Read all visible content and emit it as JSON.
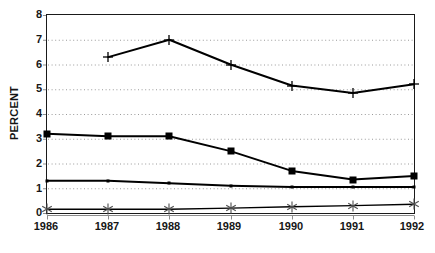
{
  "chart_data": {
    "type": "line",
    "title": "",
    "subtitle": "",
    "xlabel": "",
    "ylabel": "PERCENT",
    "categories": [
      "1986",
      "1987",
      "1988",
      "1989",
      "1990",
      "1991",
      "1992"
    ],
    "x": [
      1986,
      1987,
      1988,
      1989,
      1990,
      1991,
      1992
    ],
    "xlim": [
      1986,
      1992
    ],
    "ylim": [
      0,
      8
    ],
    "yticks": [
      0,
      1,
      2,
      3,
      4,
      5,
      6,
      7,
      8
    ],
    "ytick_labels": [
      "0",
      "1",
      "2",
      "3",
      "4",
      "5",
      "6",
      "7",
      "8"
    ],
    "xtick_labels": [
      "1986",
      "1987",
      "1988",
      "1989",
      "1990",
      "1991",
      "1992"
    ],
    "grid": "horizontal-dotted",
    "legend": "none",
    "series": [
      {
        "name": "series-plus",
        "marker": "plus",
        "color": "#000000",
        "values": [
          null,
          6.3,
          7.0,
          6.0,
          5.15,
          4.85,
          5.2
        ]
      },
      {
        "name": "series-square",
        "marker": "square",
        "color": "#000000",
        "values": [
          3.2,
          3.1,
          3.1,
          2.5,
          1.7,
          1.35,
          1.5
        ]
      },
      {
        "name": "series-line",
        "marker": "dot",
        "color": "#000000",
        "values": [
          1.3,
          1.3,
          1.2,
          1.1,
          1.05,
          1.05,
          1.05
        ]
      },
      {
        "name": "series-star",
        "marker": "star",
        "color": "#000000",
        "values": [
          0.15,
          0.15,
          0.15,
          0.2,
          0.25,
          0.3,
          0.35
        ]
      }
    ]
  },
  "axes": {
    "y_title": "PERCENT",
    "y_labels": [
      "8",
      "7",
      "6",
      "5",
      "4",
      "3",
      "2",
      "1",
      "0"
    ],
    "x_labels": [
      "1986",
      "1987",
      "1988",
      "1989",
      "1990",
      "1991",
      "1992"
    ]
  },
  "colors": {
    "frame": "#1a1a1a",
    "gridline": "#9a9a9a",
    "series": "#0d0d0d",
    "axis": "#8d8d8d",
    "background": "#ffffff"
  }
}
